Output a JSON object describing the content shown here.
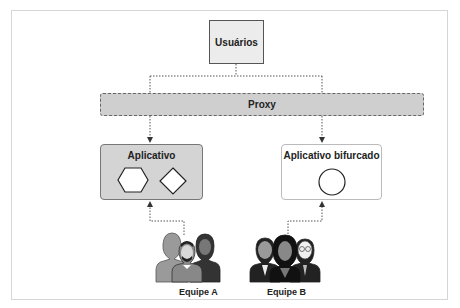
{
  "diagram": {
    "nodes": {
      "users": "Usuários",
      "proxy": "Proxy",
      "app": "Aplicativo",
      "fork": "Aplicativo bifurcado"
    },
    "teams": {
      "a": "Equipe A",
      "b": "Equipe B"
    },
    "shapes": {
      "app": [
        "hexagon",
        "diamond"
      ],
      "fork": [
        "circle"
      ]
    },
    "edges": [
      {
        "from": "users",
        "to": "proxy",
        "style": "dotted"
      },
      {
        "from": "proxy",
        "to": "app",
        "style": "dotted-arrow"
      },
      {
        "from": "proxy",
        "to": "fork",
        "style": "dotted-arrow"
      },
      {
        "from": "team_a",
        "to": "app",
        "style": "dotted-arrow"
      },
      {
        "from": "team_b",
        "to": "fork",
        "style": "dotted-arrow"
      }
    ],
    "colors": {
      "box_gray": "#d4d4d4",
      "proxy_gray": "#cfcfcf",
      "users_fill": "#ececec",
      "line": "#444444"
    }
  }
}
